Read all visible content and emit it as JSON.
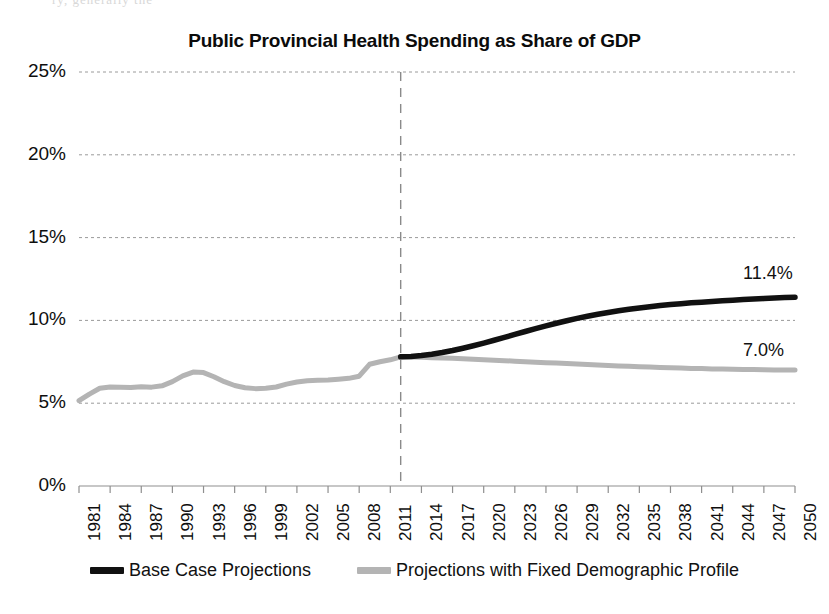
{
  "page": {
    "ghost_partial_text": "ry, generally the"
  },
  "chart_data": {
    "type": "line",
    "title": "Public Provincial Health Spending as Share of GDP",
    "xlabel": "",
    "ylabel": "",
    "xlim": [
      1981,
      2050
    ],
    "ylim": [
      0,
      25
    ],
    "y_unit": "%",
    "grid": true,
    "grid_axis": "y",
    "legend_position": "bottom",
    "yticks": [
      0,
      5,
      10,
      15,
      20,
      25
    ],
    "ytick_labels": [
      "0%",
      "5%",
      "10%",
      "15%",
      "20%",
      "25%"
    ],
    "xticks": [
      1981,
      1984,
      1987,
      1990,
      1993,
      1996,
      1999,
      2002,
      2005,
      2008,
      2011,
      2014,
      2017,
      2020,
      2023,
      2026,
      2029,
      2032,
      2035,
      2038,
      2041,
      2044,
      2047,
      2050
    ],
    "xtick_labels": [
      "1981",
      "1984",
      "1987",
      "1990",
      "1993",
      "1996",
      "1999",
      "2002",
      "2005",
      "2008",
      "2011",
      "2014",
      "2017",
      "2020",
      "2023",
      "2026",
      "2029",
      "2032",
      "2035",
      "2038",
      "2041",
      "2044",
      "2047",
      "2050"
    ],
    "projection_divider_year": 2012,
    "annotations": [
      {
        "name": "base-case-endpoint-label",
        "text": "11.4%",
        "year": 2050,
        "value": 11.4
      },
      {
        "name": "fixed-demographic-endpoint-label",
        "text": "7.0%",
        "year": 2050,
        "value": 7.0
      }
    ],
    "series": [
      {
        "name": "Base Case Projections",
        "color": "#111111",
        "x": [
          2012,
          2013,
          2014,
          2015,
          2016,
          2017,
          2018,
          2019,
          2020,
          2021,
          2022,
          2023,
          2024,
          2025,
          2026,
          2027,
          2028,
          2029,
          2030,
          2031,
          2032,
          2033,
          2034,
          2035,
          2036,
          2037,
          2038,
          2039,
          2040,
          2041,
          2042,
          2043,
          2044,
          2045,
          2046,
          2047,
          2048,
          2049,
          2050
        ],
        "values": [
          7.8,
          7.82,
          7.88,
          7.96,
          8.06,
          8.18,
          8.32,
          8.47,
          8.63,
          8.8,
          8.97,
          9.15,
          9.33,
          9.5,
          9.67,
          9.83,
          9.98,
          10.12,
          10.25,
          10.37,
          10.48,
          10.58,
          10.67,
          10.75,
          10.83,
          10.9,
          10.96,
          11.01,
          11.06,
          11.1,
          11.14,
          11.18,
          11.22,
          11.26,
          11.29,
          11.32,
          11.35,
          11.38,
          11.4
        ]
      },
      {
        "name": "Projections with Fixed Demographic Profile",
        "color": "#b4b4b4",
        "x": [
          1981,
          1982,
          1983,
          1984,
          1985,
          1986,
          1987,
          1988,
          1989,
          1990,
          1991,
          1992,
          1993,
          1994,
          1995,
          1996,
          1997,
          1998,
          1999,
          2000,
          2001,
          2002,
          2003,
          2004,
          2005,
          2006,
          2007,
          2008,
          2009,
          2010,
          2011,
          2012,
          2013,
          2014,
          2015,
          2016,
          2017,
          2018,
          2019,
          2020,
          2021,
          2022,
          2023,
          2024,
          2025,
          2026,
          2027,
          2028,
          2029,
          2030,
          2031,
          2032,
          2033,
          2034,
          2035,
          2036,
          2037,
          2038,
          2039,
          2040,
          2041,
          2042,
          2043,
          2044,
          2045,
          2046,
          2047,
          2048,
          2049,
          2050
        ],
        "values": [
          5.15,
          5.55,
          5.9,
          5.98,
          5.97,
          5.95,
          6.0,
          5.97,
          6.05,
          6.3,
          6.65,
          6.88,
          6.85,
          6.6,
          6.3,
          6.07,
          5.93,
          5.88,
          5.9,
          5.98,
          6.15,
          6.28,
          6.35,
          6.38,
          6.4,
          6.45,
          6.5,
          6.63,
          7.35,
          7.5,
          7.62,
          7.8,
          7.79,
          7.77,
          7.75,
          7.73,
          7.71,
          7.68,
          7.66,
          7.63,
          7.6,
          7.57,
          7.54,
          7.51,
          7.48,
          7.45,
          7.42,
          7.39,
          7.36,
          7.33,
          7.3,
          7.28,
          7.25,
          7.23,
          7.2,
          7.18,
          7.16,
          7.14,
          7.12,
          7.1,
          7.09,
          7.07,
          7.06,
          7.05,
          7.04,
          7.03,
          7.02,
          7.01,
          7.0,
          7.0
        ]
      }
    ]
  },
  "legend": {
    "entries": [
      {
        "label": "Base Case Projections",
        "color": "#111111"
      },
      {
        "label": "Projections with Fixed Demographic Profile",
        "color": "#b4b4b4"
      }
    ]
  }
}
